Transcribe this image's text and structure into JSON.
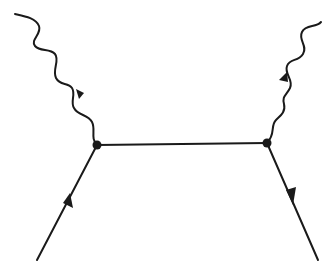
{
  "diagram": {
    "type": "feynman-diagram",
    "colors": {
      "stroke": "#1a1a1a",
      "background": "#ffffff"
    },
    "vertices": [
      {
        "id": "v1",
        "x": 97,
        "y": 145
      },
      {
        "id": "v2",
        "x": 267,
        "y": 143
      }
    ],
    "edges": [
      {
        "id": "incoming-fermion",
        "kind": "fermion",
        "from": [
          37,
          260
        ],
        "to": [
          97,
          145
        ],
        "arrow": "toward-vertex"
      },
      {
        "id": "internal-propagator",
        "kind": "fermion",
        "from": [
          97,
          145
        ],
        "to": [
          267,
          143
        ],
        "arrow": "none"
      },
      {
        "id": "outgoing-fermion",
        "kind": "fermion",
        "from": [
          267,
          143
        ],
        "to": [
          318,
          260
        ],
        "arrow": "away-from-vertex"
      },
      {
        "id": "incoming-photon",
        "kind": "photon",
        "from": [
          15,
          14
        ],
        "to": [
          97,
          145
        ],
        "arrow": "toward-vertex"
      },
      {
        "id": "outgoing-photon",
        "kind": "photon",
        "from": [
          267,
          143
        ],
        "to": [
          321,
          22
        ],
        "arrow": "away-from-vertex"
      }
    ]
  }
}
